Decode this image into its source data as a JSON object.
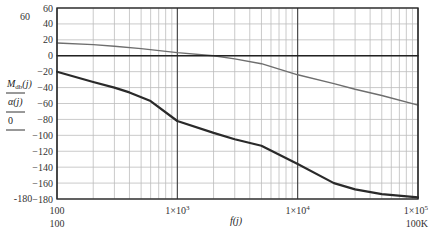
{
  "chart_data": {
    "type": "line",
    "title": "",
    "xscale": "log",
    "xlim": [
      100,
      100000
    ],
    "ylim": [
      -180,
      60
    ],
    "grid": true,
    "xlabel": "f(j)",
    "ylabel_lines": [
      "M_db(j)",
      "α(j)",
      "0"
    ],
    "ylabel_parts": {
      "mag_main": "M",
      "mag_sub": "db",
      "mag_arg": "(j)",
      "phase": "α(j)",
      "zero": "0"
    },
    "x_ticks": [
      {
        "value": 100,
        "label": "100",
        "sublabel": "100"
      },
      {
        "value": 1000,
        "label": "1×10",
        "exp": "3"
      },
      {
        "value": 10000,
        "label": "1×10",
        "exp": "4"
      },
      {
        "value": 100000,
        "label": "1×10",
        "exp": "5",
        "sublabel": "100K"
      }
    ],
    "y_ticks": [
      60,
      40,
      20,
      0,
      -20,
      -40,
      -60,
      -80,
      -100,
      -120,
      -140,
      -160,
      -180
    ],
    "y_extra_labels": {
      "top": "60",
      "bottom": "-180"
    },
    "series": [
      {
        "name": "M_db(j)",
        "color": "#6e6e6e",
        "width": 1.4,
        "x": [
          100,
          200,
          300,
          500,
          1000,
          2000,
          3000,
          5000,
          10000,
          20000,
          30000,
          50000,
          100000
        ],
        "y": [
          16,
          14,
          12,
          9,
          4,
          0,
          -4,
          -10,
          -24,
          -35,
          -42,
          -50,
          -62
        ]
      },
      {
        "name": "α(j)",
        "color": "#2a2a2a",
        "width": 2.2,
        "x": [
          100,
          200,
          300,
          400,
          600,
          1000,
          2000,
          3000,
          5000,
          10000,
          20000,
          30000,
          50000,
          100000
        ],
        "y": [
          -20,
          -33,
          -40,
          -46,
          -57,
          -82,
          -97,
          -105,
          -113,
          -136,
          -160,
          -168,
          -174,
          -178
        ]
      },
      {
        "name": "0",
        "color": "#222222",
        "width": 1.6,
        "x": [
          100,
          100000
        ],
        "y": [
          0,
          0
        ]
      }
    ]
  }
}
